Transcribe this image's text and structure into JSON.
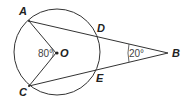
{
  "diagram": {
    "points": {
      "A": {
        "label": "A"
      },
      "B": {
        "label": "B"
      },
      "C": {
        "label": "C"
      },
      "D": {
        "label": "D"
      },
      "E": {
        "label": "E"
      },
      "O": {
        "label": "O"
      }
    },
    "angles": {
      "AOC": "80°",
      "B": "20°"
    },
    "stroke_color": "#333333"
  }
}
